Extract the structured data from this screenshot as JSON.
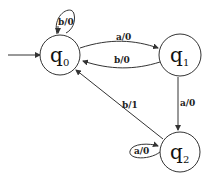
{
  "diagram": {
    "type": "finite-state-machine",
    "states": [
      {
        "id": "q0",
        "label": "q",
        "subscript": "0",
        "initial": true
      },
      {
        "id": "q1",
        "label": "q",
        "subscript": "1",
        "initial": false
      },
      {
        "id": "q2",
        "label": "q",
        "subscript": "2",
        "initial": false
      }
    ],
    "transitions": [
      {
        "from": "q0",
        "to": "q0",
        "label": "b/0"
      },
      {
        "from": "q0",
        "to": "q1",
        "label": "a/0"
      },
      {
        "from": "q1",
        "to": "q0",
        "label": "b/0"
      },
      {
        "from": "q1",
        "to": "q2",
        "label": "a/0"
      },
      {
        "from": "q2",
        "to": "q2",
        "label": "a/0"
      },
      {
        "from": "q2",
        "to": "q0",
        "label": "b/1"
      }
    ],
    "colors": {
      "stroke": "#333333",
      "background": "#ffffff"
    }
  }
}
